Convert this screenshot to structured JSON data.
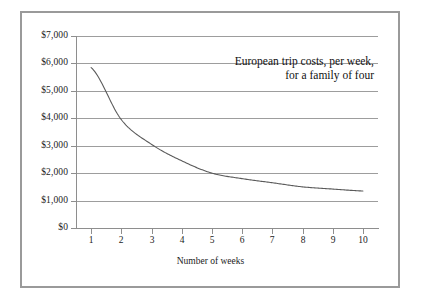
{
  "figure": {
    "background_color": "#ffffff",
    "frame_color": "#9a9a9a",
    "gridline_color": "#9d9d9d",
    "axis_color": "#8e8e8e",
    "curve_color": "#5a5a5a"
  },
  "chart_data": {
    "type": "line",
    "title": "",
    "annotation_lines": [
      "European trip costs, per week,",
      "for a family of four"
    ],
    "xlabel": "Number of weeks",
    "ylabel": "",
    "xlim": [
      0.5,
      10.5
    ],
    "ylim": [
      0,
      7000
    ],
    "grid": true,
    "legend": "none",
    "x_tick_labels": [
      "1",
      "2",
      "3",
      "4",
      "5",
      "6",
      "7",
      "8",
      "9",
      "10"
    ],
    "y_tick_labels": [
      "$0",
      "$1,000",
      "$2,000",
      "$3,000",
      "$4,000",
      "$5,000",
      "$6,000",
      "$7,000"
    ],
    "y_tick_values": [
      0,
      1000,
      2000,
      3000,
      4000,
      5000,
      6000,
      7000
    ],
    "x": [
      1,
      2,
      3,
      4,
      5,
      6,
      7,
      8,
      9,
      10
    ],
    "values": [
      5850,
      3950,
      3050,
      2450,
      2000,
      1800,
      1650,
      1500,
      1420,
      1350
    ],
    "series": [
      {
        "name": "European trip costs per week for a family of four",
        "values": [
          5850,
          3950,
          3050,
          2450,
          2000,
          1800,
          1650,
          1500,
          1420,
          1350
        ]
      }
    ]
  }
}
